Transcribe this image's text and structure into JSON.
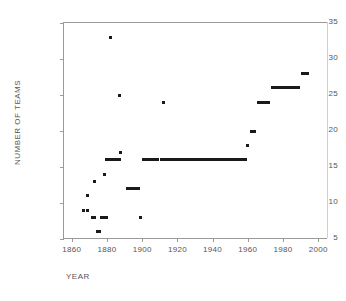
{
  "chart_data": {
    "type": "scatter",
    "title": "",
    "xlabel": "YEAR",
    "ylabel": "NUMBER OF TEAMS",
    "xlim": [
      1855,
      2005
    ],
    "ylim": [
      5,
      35
    ],
    "xticks": [
      1860,
      1880,
      1900,
      1920,
      1940,
      1960,
      1980,
      2000
    ],
    "yticks": [
      5,
      10,
      15,
      20,
      25,
      30,
      35
    ],
    "grid": false,
    "legend": null,
    "marker_color": "#1a1a1a",
    "axis_color": "#9a9a9a",
    "background": "#ffffff",
    "series": [
      {
        "name": "Number of major league teams",
        "points": [
          {
            "year": 1866,
            "teams": 9
          },
          {
            "year": 1868,
            "teams": 9
          },
          {
            "year": 1868,
            "teams": 11
          },
          {
            "year": 1871,
            "teams": 8
          },
          {
            "year": 1872,
            "teams": 8
          },
          {
            "year": 1872,
            "teams": 13
          },
          {
            "year": 1874,
            "teams": 6
          },
          {
            "year": 1875,
            "teams": 6
          },
          {
            "year": 1876,
            "teams": 8
          },
          {
            "year": 1877,
            "teams": 8
          },
          {
            "year": 1878,
            "teams": 8
          },
          {
            "year": 1878,
            "teams": 14
          },
          {
            "year": 1880,
            "teams": 16
          },
          {
            "year": 1881,
            "teams": 33
          },
          {
            "year": 1882,
            "teams": 16
          },
          {
            "year": 1883,
            "teams": 16
          },
          {
            "year": 1884,
            "teams": 16
          },
          {
            "year": 1885,
            "teams": 16
          },
          {
            "year": 1886,
            "teams": 25
          },
          {
            "year": 1887,
            "teams": 17
          },
          {
            "year": 1891,
            "teams": 12
          },
          {
            "year": 1893,
            "teams": 12
          },
          {
            "year": 1895,
            "teams": 12
          },
          {
            "year": 1897,
            "teams": 12
          },
          {
            "year": 1898,
            "teams": 8
          },
          {
            "year": 1901,
            "teams": 16
          },
          {
            "year": 1903,
            "teams": 16
          },
          {
            "year": 1905,
            "teams": 16
          },
          {
            "year": 1907,
            "teams": 16
          },
          {
            "year": 1910,
            "teams": 16
          },
          {
            "year": 1911,
            "teams": 24
          },
          {
            "year": 1914,
            "teams": 16
          },
          {
            "year": 1918,
            "teams": 16
          },
          {
            "year": 1922,
            "teams": 16
          },
          {
            "year": 1926,
            "teams": 16
          },
          {
            "year": 1930,
            "teams": 16
          },
          {
            "year": 1934,
            "teams": 16
          },
          {
            "year": 1938,
            "teams": 16
          },
          {
            "year": 1942,
            "teams": 16
          },
          {
            "year": 1946,
            "teams": 16
          },
          {
            "year": 1950,
            "teams": 16
          },
          {
            "year": 1954,
            "teams": 16
          },
          {
            "year": 1958,
            "teams": 16
          },
          {
            "year": 1959,
            "teams": 18
          },
          {
            "year": 1961,
            "teams": 20
          },
          {
            "year": 1962,
            "teams": 20
          },
          {
            "year": 1963,
            "teams": 20
          },
          {
            "year": 1965,
            "teams": 24
          },
          {
            "year": 1967,
            "teams": 24
          },
          {
            "year": 1969,
            "teams": 24
          },
          {
            "year": 1971,
            "teams": 24
          },
          {
            "year": 1974,
            "teams": 26
          },
          {
            "year": 1978,
            "teams": 26
          },
          {
            "year": 1982,
            "teams": 26
          },
          {
            "year": 1986,
            "teams": 26
          },
          {
            "year": 1990,
            "teams": 28
          },
          {
            "year": 1992,
            "teams": 28
          }
        ],
        "runs": [
          {
            "year_start": 1866,
            "year_end": 1866,
            "teams": 9
          },
          {
            "year_start": 1868,
            "year_end": 1868,
            "teams": 9
          },
          {
            "year_start": 1868,
            "year_end": 1868,
            "teams": 11
          },
          {
            "year_start": 1871,
            "year_end": 1872,
            "teams": 8
          },
          {
            "year_start": 1872,
            "year_end": 1872,
            "teams": 13
          },
          {
            "year_start": 1874,
            "year_end": 1875,
            "teams": 6
          },
          {
            "year_start": 1876,
            "year_end": 1879,
            "teams": 8
          },
          {
            "year_start": 1878,
            "year_end": 1878,
            "teams": 14
          },
          {
            "year_start": 1879,
            "year_end": 1881,
            "teams": 16
          },
          {
            "year_start": 1881,
            "year_end": 1881,
            "teams": 33
          },
          {
            "year_start": 1883,
            "year_end": 1886,
            "teams": 16
          },
          {
            "year_start": 1886,
            "year_end": 1886,
            "teams": 25
          },
          {
            "year_start": 1887,
            "year_end": 1887,
            "teams": 17
          },
          {
            "year_start": 1891,
            "year_end": 1897,
            "teams": 12
          },
          {
            "year_start": 1898,
            "year_end": 1898,
            "teams": 8
          },
          {
            "year_start": 1900,
            "year_end": 1908,
            "teams": 16
          },
          {
            "year_start": 1910,
            "year_end": 1911,
            "teams": 16
          },
          {
            "year_start": 1911,
            "year_end": 1911,
            "teams": 24
          },
          {
            "year_start": 1913,
            "year_end": 1958,
            "teams": 16
          },
          {
            "year_start": 1959,
            "year_end": 1959,
            "teams": 18
          },
          {
            "year_start": 1961,
            "year_end": 1963,
            "teams": 20
          },
          {
            "year_start": 1965,
            "year_end": 1971,
            "teams": 24
          },
          {
            "year_start": 1973,
            "year_end": 1988,
            "teams": 26
          },
          {
            "year_start": 1990,
            "year_end": 1993,
            "teams": 28
          }
        ]
      }
    ]
  }
}
